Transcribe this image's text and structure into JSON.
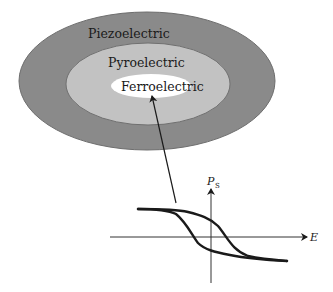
{
  "diagram": {
    "sets": [
      {
        "label": "Piezoelectric",
        "fill": "#8a8a8a"
      },
      {
        "label": "Pyroelectric",
        "fill": "#c2c2c2"
      },
      {
        "label": "Ferroelectric",
        "fill": "#ffffff"
      }
    ],
    "plot": {
      "x_axis_label": "E",
      "y_axis_label": "P",
      "y_axis_subscript": "S",
      "curve": "hysteresis-loop"
    },
    "arrow": {
      "from": "hysteresis-loop",
      "to": "Ferroelectric"
    }
  }
}
